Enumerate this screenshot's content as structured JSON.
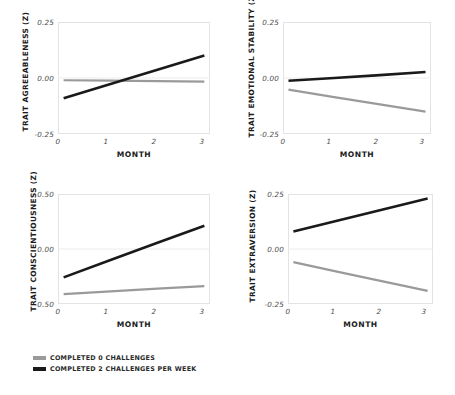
{
  "figure": {
    "background": "#ffffff",
    "legend": {
      "items": [
        {
          "label": "COMPLETED 0 CHALLENGES",
          "color": "#9a9a9a"
        },
        {
          "label": "COMPLETED 2 CHALLENGES PER WEEK",
          "color": "#1a1a1a"
        }
      ]
    }
  },
  "chart_data": [
    {
      "id": "agreeableness",
      "type": "line",
      "title": "",
      "xlabel": "MONTH",
      "ylabel": "TRAIT AGREEABLENESS (Z)",
      "x": [
        0,
        1,
        2,
        3
      ],
      "xticks": [
        "0",
        "1",
        "2",
        "3"
      ],
      "xlim": [
        -0.12,
        3.12
      ],
      "yticks": [
        "0.25",
        "0.00",
        "-0.25"
      ],
      "ytickvals": [
        0.25,
        0.0,
        -0.25
      ],
      "ylim": [
        -0.25,
        0.25
      ],
      "grid": true,
      "legend_position": "figure-bottom-left",
      "series": [
        {
          "name": "COMPLETED 0 CHALLENGES",
          "color": "#9a9a9a",
          "values": [
            -0.01,
            -0.012,
            -0.014,
            -0.016
          ]
        },
        {
          "name": "COMPLETED 2 CHALLENGES PER WEEK",
          "color": "#1a1a1a",
          "values": [
            -0.09,
            -0.027,
            0.037,
            0.1
          ]
        }
      ]
    },
    {
      "id": "emotional-stability",
      "type": "line",
      "title": "",
      "xlabel": "MONTH",
      "ylabel": "TRAIT EMOTIONAL STABILITY (Z)",
      "x": [
        0,
        1,
        2,
        3
      ],
      "xticks": [
        "0",
        "1",
        "2",
        "3"
      ],
      "xlim": [
        -0.12,
        3.12
      ],
      "yticks": [
        "0.25",
        "0.00",
        "-0.25"
      ],
      "ytickvals": [
        0.25,
        0.0,
        -0.25
      ],
      "ylim": [
        -0.25,
        0.25
      ],
      "grid": true,
      "legend_position": "figure-bottom-left",
      "series": [
        {
          "name": "COMPLETED 0 CHALLENGES",
          "color": "#9a9a9a",
          "values": [
            -0.052,
            -0.085,
            -0.118,
            -0.15
          ]
        },
        {
          "name": "COMPLETED 2 CHALLENGES PER WEEK",
          "color": "#1a1a1a",
          "values": [
            -0.012,
            0.0,
            0.013,
            0.027
          ]
        }
      ]
    },
    {
      "id": "conscientiousness",
      "type": "line",
      "title": "",
      "xlabel": "MONTH",
      "ylabel": "TRAIT CONSCIENTIOUSNESS (Z)",
      "x": [
        0,
        1,
        2,
        3
      ],
      "xticks": [
        "0",
        "1",
        "2",
        "3"
      ],
      "xlim": [
        -0.12,
        3.12
      ],
      "yticks": [
        "0.50",
        "0.00",
        "-0.50"
      ],
      "ytickvals": [
        0.5,
        0.0,
        -0.5
      ],
      "ylim": [
        -0.5,
        0.5
      ],
      "grid": true,
      "legend_position": "figure-bottom-left",
      "series": [
        {
          "name": "COMPLETED 0 CHALLENGES",
          "color": "#9a9a9a",
          "values": [
            -0.41,
            -0.385,
            -0.36,
            -0.338
          ]
        },
        {
          "name": "COMPLETED 2 CHALLENGES PER WEEK",
          "color": "#1a1a1a",
          "values": [
            -0.258,
            -0.1,
            0.057,
            0.212
          ]
        }
      ]
    },
    {
      "id": "extraversion",
      "type": "line",
      "title": "",
      "xlabel": "MONTH",
      "ylabel": "TRAIT EXTRAVERSION (Z)",
      "x": [
        0,
        1,
        2,
        3
      ],
      "xticks": [
        "0",
        "1",
        "2",
        "3"
      ],
      "xlim": [
        -0.12,
        3.12
      ],
      "yticks": [
        "0.25",
        "0.00",
        "-0.25"
      ],
      "ytickvals": [
        0.25,
        0.0,
        -0.25
      ],
      "ylim": [
        -0.25,
        0.25
      ],
      "grid": true,
      "legend_position": "figure-bottom-left",
      "series": [
        {
          "name": "COMPLETED 0 CHALLENGES",
          "color": "#9a9a9a",
          "values": [
            -0.06,
            -0.104,
            -0.147,
            -0.19
          ]
        },
        {
          "name": "COMPLETED 2 CHALLENGES PER WEEK",
          "color": "#1a1a1a",
          "values": [
            0.08,
            0.13,
            0.18,
            0.23
          ]
        }
      ]
    }
  ]
}
